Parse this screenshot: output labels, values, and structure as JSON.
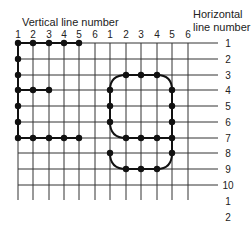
{
  "titles": {
    "vertical": "Vertical line number",
    "horizontal_line1": "Horizontal",
    "horizontal_line2": "line number"
  },
  "vertical_labels": [
    "1",
    "2",
    "3",
    "4",
    "5",
    "6",
    "1",
    "2",
    "3",
    "4",
    "5",
    "6"
  ],
  "horizontal_labels": [
    "1",
    "2",
    "3",
    "4",
    "5",
    "6",
    "7",
    "8",
    "9",
    "10",
    "1",
    "2"
  ],
  "grid": {
    "x": [
      18,
      33,
      49,
      64,
      79,
      95,
      110,
      126,
      141,
      157,
      172,
      188
    ],
    "y": [
      43,
      59,
      75,
      90,
      106,
      122,
      138,
      153,
      169,
      185
    ],
    "extra_label_y": [
      201,
      217
    ],
    "x_end": 218,
    "y_end": 200,
    "line_color": "#333333",
    "dot_color": "#111111"
  },
  "figures": [
    {
      "name": "letter-E-left",
      "description": "Left character drawn on grid columns 1-5",
      "dots": [
        [
          1,
          1
        ],
        [
          2,
          1
        ],
        [
          3,
          1
        ],
        [
          4,
          1
        ],
        [
          5,
          1
        ],
        [
          1,
          2
        ],
        [
          1,
          3
        ],
        [
          1,
          4
        ],
        [
          2,
          4
        ],
        [
          3,
          4
        ],
        [
          1,
          5
        ],
        [
          1,
          6
        ],
        [
          1,
          7
        ],
        [
          2,
          7
        ],
        [
          3,
          7
        ],
        [
          4,
          7
        ],
        [
          5,
          7
        ]
      ]
    },
    {
      "name": "rounded-figure-right",
      "description": "Right character drawn on grid columns 1-5 (second set)",
      "dots": [
        [
          8,
          3
        ],
        [
          9,
          3
        ],
        [
          10,
          3
        ],
        [
          7,
          4
        ],
        [
          11,
          4
        ],
        [
          7,
          5
        ],
        [
          11,
          5
        ],
        [
          7,
          6
        ],
        [
          11,
          6
        ],
        [
          8,
          7
        ],
        [
          9,
          7
        ],
        [
          10,
          7
        ],
        [
          11,
          7
        ],
        [
          7,
          8
        ],
        [
          11,
          8
        ],
        [
          8,
          9
        ],
        [
          9,
          9
        ],
        [
          10,
          9
        ]
      ]
    }
  ]
}
